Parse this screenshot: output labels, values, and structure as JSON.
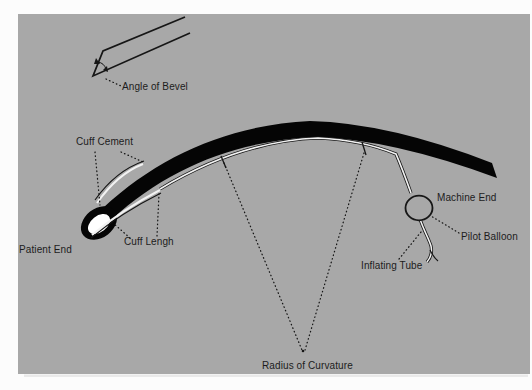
{
  "figure": {
    "labels": {
      "angle_of_bevel": "Angle of Bevel",
      "cuff_cement": "Cuff Cement",
      "patient_end": "Patient End",
      "cuff_lengh": "Cuff Lengh",
      "machine_end": "Machine End",
      "pilot_balloon": "Pilot Balloon",
      "inflating_tube": "Inflating Tube",
      "radius_of_curvature": "Radius of Curvature"
    },
    "colors": {
      "page_bg": "#fcfcfc",
      "panel_bg": "#a8a8a8",
      "tube_fill": "#050505",
      "line": "#161616",
      "white_line": "#f2f2f2",
      "lumen": "#ffffff",
      "shadow": "#d9d9d9",
      "label_text": "#1c1c1c"
    }
  }
}
